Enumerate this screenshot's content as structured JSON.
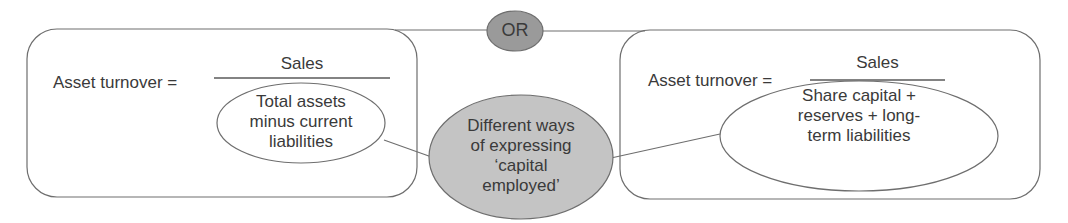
{
  "colors": {
    "line": "#6e6e6e",
    "text": "#3a3a3a",
    "or_fill": "#9a9a9a",
    "center_fill": "#c4c4c4",
    "background": "#ffffff"
  },
  "connector": {
    "label": "OR"
  },
  "center_node": {
    "lines": [
      "Different ways",
      "of expressing",
      "‘capital",
      "employed’"
    ]
  },
  "left_formula": {
    "lhs": "Asset turnover =",
    "numerator": "Sales",
    "denominator_lines": [
      "Total assets",
      "minus current",
      "liabilities"
    ]
  },
  "right_formula": {
    "lhs": "Asset turnover =",
    "numerator": "Sales",
    "denominator_lines": [
      "Share capital +",
      "reserves + long-",
      "term liabilities"
    ]
  }
}
